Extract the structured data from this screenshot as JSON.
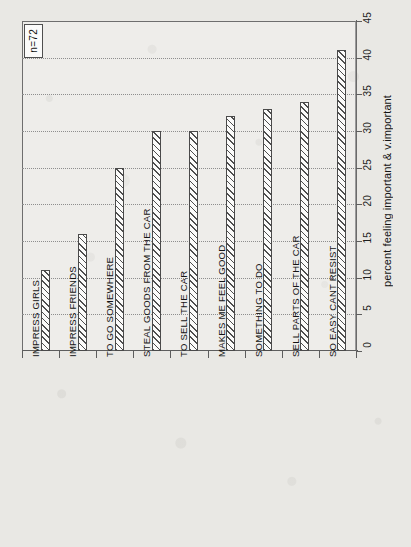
{
  "chart_data": {
    "type": "bar",
    "title": "",
    "subtitle": "",
    "xlabel": "",
    "ylabel": "percent feeling important & v.important",
    "ylim": [
      0,
      45
    ],
    "ytick_values": [
      0,
      5,
      10,
      15,
      20,
      25,
      30,
      35,
      40,
      45
    ],
    "ytick_labels": [
      "0",
      "5",
      "10",
      "15",
      "20",
      "25",
      "30",
      "35",
      "40",
      "45"
    ],
    "grid": true,
    "grid_axis": "y",
    "legend": false,
    "orientation": "vertical",
    "rotated_layout": true,
    "categories": [
      "IMPRESS GIRLS",
      "IMPRESS FRIENDS",
      "TO GO SOMEWHERE",
      "STEAL GOODS FROM THE CAR",
      "TO SELL THE CAR",
      "MAKES ME FEEL GOOD",
      "SOMETHING TO DO",
      "SELL PARTS OF THE CAR",
      "SO EASY CANT RESIST"
    ],
    "values": [
      11,
      16,
      25,
      30,
      30,
      32,
      33,
      34,
      41
    ],
    "annotations": [
      {
        "text": "n=72",
        "position": "top-left",
        "boxed": true
      }
    ],
    "bar_style": {
      "fill": "hatched-diagonal",
      "edge_color": "#4a4a4a",
      "face_color": "#fbfbfa"
    }
  },
  "figure": {
    "background_color": "#e9e8e4",
    "plot_background_color": "#fdfdfc",
    "axis_color": "#5d5d5d",
    "grid_color": "#8e8e8e",
    "text_color": "#141414"
  }
}
